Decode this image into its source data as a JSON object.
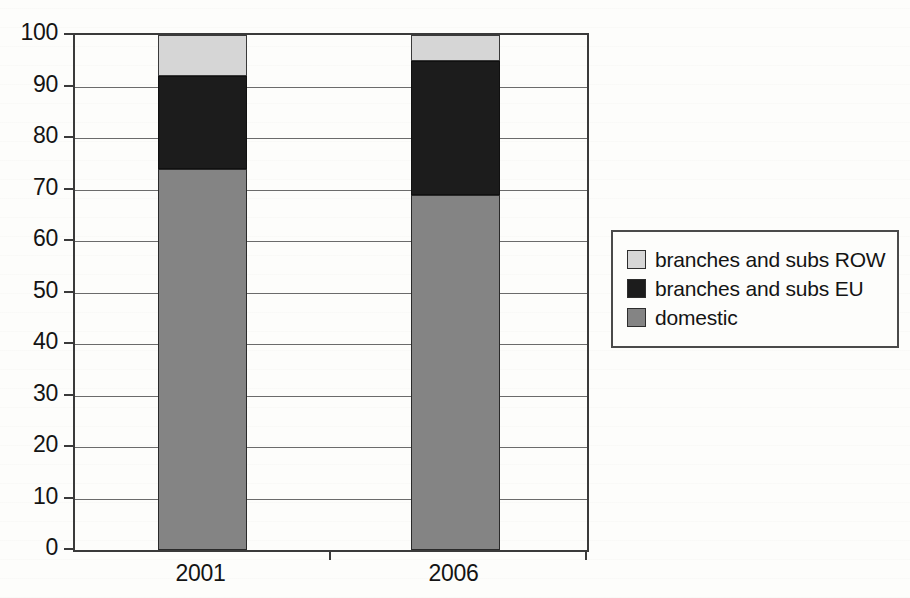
{
  "chart_data": {
    "type": "bar",
    "subtype": "stacked-percentage-column",
    "title": "",
    "subtitle": "",
    "xlabel": "",
    "ylabel": "",
    "categories": [
      "2001",
      "2006"
    ],
    "series": [
      {
        "name": "domestic",
        "key": "domestic",
        "color": "#848484",
        "values": [
          74,
          69
        ]
      },
      {
        "name": "branches and subs EU",
        "key": "eu",
        "color": "#1c1c1c",
        "values": [
          18,
          26
        ]
      },
      {
        "name": "branches and subs ROW",
        "key": "row",
        "color": "#d6d6d6",
        "values": [
          8,
          5
        ]
      }
    ],
    "stack_order_bottom_to_top": [
      "domestic",
      "branches and subs EU",
      "branches and subs ROW"
    ],
    "cumulative_tops": {
      "2001": {
        "domestic": 74,
        "branches and subs EU": 92,
        "branches and subs ROW": 100
      },
      "2006": {
        "domestic": 69,
        "branches and subs EU": 95,
        "branches and subs ROW": 100
      }
    },
    "ylim": [
      0,
      100
    ],
    "ytick_step": 10,
    "ytick_labels": [
      "100",
      "90",
      "80",
      "70",
      "60",
      "50",
      "40",
      "30",
      "20",
      "10",
      "0"
    ],
    "ytick_values": [
      100,
      90,
      80,
      70,
      60,
      50,
      40,
      30,
      20,
      10,
      0
    ],
    "grid": true,
    "grid_axis": "y",
    "legend": {
      "position": "right",
      "border": true,
      "entries": [
        {
          "label": "branches and subs ROW",
          "color": "#d6d6d6"
        },
        {
          "label": "branches and subs EU",
          "color": "#1c1c1c"
        },
        {
          "label": "domestic",
          "color": "#848484"
        }
      ]
    },
    "colors": {
      "domestic": "#848484",
      "branches_and_subs_eu": "#1c1c1c",
      "branches_and_subs_row": "#d6d6d6",
      "axis": "#3a3a3a",
      "gridline": "#6b6b6b",
      "background": "#fdfdfb",
      "text": "#141414"
    }
  },
  "axes": {
    "y_ticks": [
      {
        "label": "100",
        "value": 100
      },
      {
        "label": "90",
        "value": 90
      },
      {
        "label": "80",
        "value": 80
      },
      {
        "label": "70",
        "value": 70
      },
      {
        "label": "60",
        "value": 60
      },
      {
        "label": "50",
        "value": 50
      },
      {
        "label": "40",
        "value": 40
      },
      {
        "label": "30",
        "value": 30
      },
      {
        "label": "20",
        "value": 20
      },
      {
        "label": "10",
        "value": 10
      },
      {
        "label": "0",
        "value": 0
      }
    ],
    "x_ticks": [
      {
        "label": "2001"
      },
      {
        "label": "2006"
      }
    ]
  },
  "legend": {
    "items": [
      {
        "label": "branches and subs ROW"
      },
      {
        "label": "branches and subs EU"
      },
      {
        "label": "domestic"
      }
    ]
  }
}
